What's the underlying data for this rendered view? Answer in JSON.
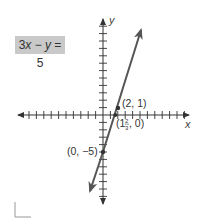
{
  "equation_label": "3x − y = 5",
  "colors": {
    "line": "#555555",
    "axis": "#333333",
    "equation_box_bg": "#c9c9c9",
    "text": "#333333"
  },
  "chart_data": {
    "type": "line",
    "title": "3x − y = 5",
    "xlabel": "x",
    "ylabel": "y",
    "xlim": [
      -11.5,
      11.8
    ],
    "ylim": [
      -12,
      12.8
    ],
    "grid": false,
    "tick_interval": 1,
    "series": [
      {
        "name": "3x − y = 5",
        "equation": "y = 3x − 5",
        "slope": 3,
        "y_intercept": -5,
        "x": [
          -1.8,
          0,
          1.6667,
          2,
          5.3
        ],
        "y": [
          -10.4,
          -5,
          0,
          1,
          10.9
        ]
      }
    ],
    "annotations": [
      {
        "label": "(2, 1)",
        "x": 2,
        "y": 1
      },
      {
        "label": "(1⅔, 0)",
        "x": 1.6667,
        "y": 0
      },
      {
        "label": "(0, −5)",
        "x": 0,
        "y": -5
      }
    ]
  },
  "labels": {
    "point_a": "(2, 1)",
    "point_b_whole": "(1",
    "point_b_num": "2",
    "point_b_den": "3",
    "point_b_rest": ", 0)",
    "point_c": "(0, −5)",
    "x_axis": "x",
    "y_axis": "y"
  }
}
